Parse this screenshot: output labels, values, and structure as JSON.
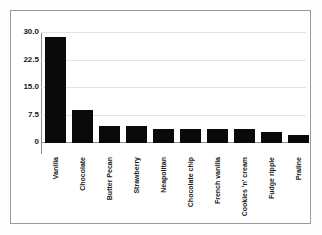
{
  "chart_data": {
    "type": "bar",
    "title": "",
    "subtitle": "",
    "xlabel": "",
    "ylabel": "",
    "categories": [
      "Vanilla",
      "Chocolate",
      "Butter Pecan",
      "Strawberry",
      "Neapolitan",
      "Chocolate chip",
      "French vanilla",
      "Cookies 'n' cream",
      "Fudge ripple",
      "Praline"
    ],
    "values": [
      29.0,
      8.9,
      4.7,
      4.7,
      3.9,
      3.9,
      3.9,
      3.9,
      3.1,
      2.2
    ],
    "ylim": [
      0,
      30
    ],
    "yticks": [
      0,
      7.5,
      15.0,
      22.5,
      30.0
    ],
    "ytick_labels": [
      "0",
      "7.5",
      "15.0",
      "22.5",
      "30.0"
    ],
    "grid": true,
    "grid_axis": "y",
    "legend": false,
    "legend_position": "none",
    "bar_color": "#0a0a0a",
    "gridline_color": "#e3e3e3",
    "axis_color": "#8c8c8c",
    "frame_color": "#9a9a9a",
    "background_color": "#ffffff"
  }
}
